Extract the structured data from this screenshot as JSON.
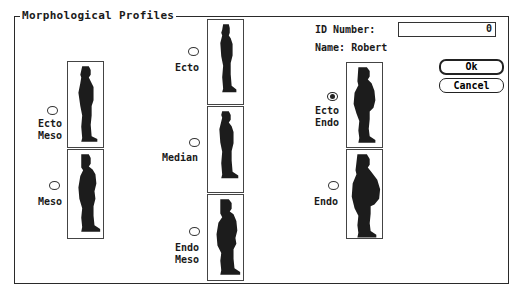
{
  "dialog": {
    "title": "Morphological Profiles"
  },
  "fields": {
    "id_label": "ID Number:",
    "id_value": "0",
    "name_label": "Name:",
    "name_value": "Robert"
  },
  "buttons": {
    "ok": "Ok",
    "cancel": "Cancel"
  },
  "profiles": [
    {
      "id": "ecto-meso",
      "line1": "Ecto",
      "line2": "Meso",
      "selected": false
    },
    {
      "id": "meso",
      "line1": "Meso",
      "line2": "",
      "selected": false
    },
    {
      "id": "ecto",
      "line1": "Ecto",
      "line2": "",
      "selected": false
    },
    {
      "id": "median",
      "line1": "Median",
      "line2": "",
      "selected": false
    },
    {
      "id": "endo-meso",
      "line1": "Endo",
      "line2": "Meso",
      "selected": false
    },
    {
      "id": "ecto-endo",
      "line1": "Ecto",
      "line2": "Endo",
      "selected": true
    },
    {
      "id": "endo",
      "line1": "Endo",
      "line2": "",
      "selected": false
    }
  ],
  "colors": {
    "silhouette": "#1c1c1c",
    "border": "#2a2a2a",
    "background": "#ffffff"
  }
}
